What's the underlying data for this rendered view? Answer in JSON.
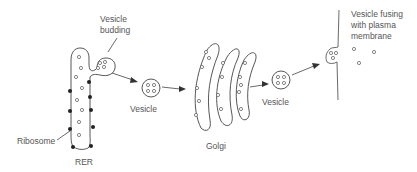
{
  "diagram": {
    "type": "biology-secretory-pathway",
    "labels": {
      "vesicle_budding_line1": "Vesicle",
      "vesicle_budding_line2": "budding",
      "ribosome": "Ribosome",
      "rer": "RER",
      "vesicle_1": "Vesicle",
      "golgi": "Golgi",
      "vesicle_2": "Vesicle",
      "fusing_line1": "Vesicle fusing",
      "fusing_line2": "with plasma",
      "fusing_line3": "membrane"
    },
    "stages": [
      {
        "name": "RER",
        "description": "Rough endoplasmic reticulum with ribosomes"
      },
      {
        "name": "Vesicle budding",
        "description": "Vesicle buds off RER"
      },
      {
        "name": "Vesicle",
        "description": "Transport vesicle to Golgi"
      },
      {
        "name": "Golgi",
        "description": "Three stacked cisternae"
      },
      {
        "name": "Vesicle",
        "description": "Transport vesicle from Golgi"
      },
      {
        "name": "Vesicle fusing with plasma membrane",
        "description": "Exocytosis releasing contents"
      }
    ],
    "colors": {
      "outline": "#444444",
      "ribosome": "#222222",
      "text": "#555555",
      "background": "#ffffff"
    }
  }
}
